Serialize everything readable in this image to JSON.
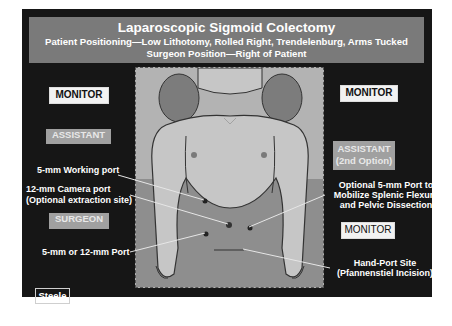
{
  "title": "Laparoscopic Sigmoid Colectomy",
  "subtitle_positioning": "Patient Positioning—Low Lithotomy, Rolled Right, Trendelenburg, Arms Tucked",
  "subtitle_surgeon": "Surgeon Position—Right of Patient",
  "left": {
    "monitor": "MONITOR",
    "assistant": "ASSISTANT",
    "working_port": "5-mm Working port",
    "camera_port_line1": "12-mm Camera port",
    "camera_port_line2": "(Optional extraction site)",
    "surgeon": "SURGEON",
    "port_5_12": "5-mm or 12-mm Port"
  },
  "right": {
    "monitor_top": "MONITOR",
    "assistant_line1": "ASSISTANT",
    "assistant_line2": "(2nd Option)",
    "optional_port_line1": "Optional 5-mm Port to",
    "optional_port_line2": "Mobilize Splenic Flexure",
    "optional_port_line3": "and Pelvic Dissection",
    "monitor_bottom": "MONITOR",
    "hand_port_line1": "Hand-Port Site",
    "hand_port_line2": "(Pfannenstiel Incision)"
  },
  "credit": "Steele",
  "colors": {
    "frame": "#161616",
    "banner": "#7a7a7a",
    "panel": "#b3b3b3",
    "skin": "#c6c6c6",
    "drape": "#8e8e8e",
    "pillow": "#7c7c7c",
    "port_dot": "#222222",
    "leader_line": "#e6e6e6"
  }
}
